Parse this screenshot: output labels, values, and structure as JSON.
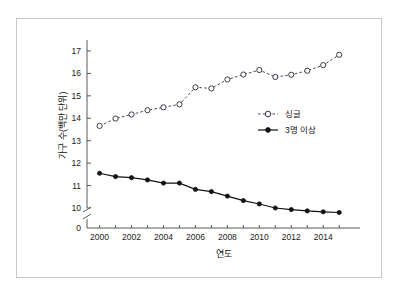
{
  "figure": {
    "frame_border_color": "#c9c9c9",
    "background_color": "#ffffff"
  },
  "axis": {
    "x_title": "연도",
    "y_title": "가구 수(백만 단위)",
    "y_zero_label": "0",
    "y_tick_labels": [
      "10",
      "11",
      "12",
      "13",
      "14",
      "15",
      "16",
      "17"
    ],
    "x_tick_labels": [
      "2000",
      "2002",
      "2004",
      "2006",
      "2008",
      "2010",
      "2012",
      "2014"
    ],
    "break_symbol": "axis-break"
  },
  "legend": {
    "entries": [
      {
        "label": "싱글",
        "marker": "open-circle",
        "line": "dashed",
        "color": "#3a3a44"
      },
      {
        "label": "3명 이상",
        "marker": "filled-circle",
        "line": "solid",
        "color": "#111111"
      }
    ]
  },
  "chart_data": {
    "type": "line",
    "title": "",
    "xlabel": "연도",
    "ylabel": "가구 수(백만 단위)",
    "x": [
      2000,
      2001,
      2002,
      2003,
      2004,
      2005,
      2006,
      2007,
      2008,
      2009,
      2010,
      2011,
      2012,
      2013,
      2014,
      2015
    ],
    "xlim": [
      1999.4,
      2015.8
    ],
    "ylim": [
      10,
      17.4
    ],
    "y_axis_break": {
      "from": 0,
      "to": 10
    },
    "grid": false,
    "legend_position": "center-right",
    "series": [
      {
        "name": "싱글",
        "marker": "open-circle",
        "linestyle": "dashed",
        "color": "#3a3a44",
        "values": [
          13.66,
          13.99,
          14.17,
          14.36,
          14.49,
          14.62,
          15.38,
          15.33,
          15.73,
          15.95,
          16.15,
          15.84,
          15.94,
          16.12,
          16.37,
          16.83
        ]
      },
      {
        "name": "3명 이상",
        "marker": "filled-circle",
        "linestyle": "solid",
        "color": "#111111",
        "values": [
          11.55,
          11.4,
          11.35,
          11.25,
          11.11,
          11.11,
          10.83,
          10.73,
          10.53,
          10.33,
          10.18,
          10.0,
          9.93,
          9.87,
          9.83,
          9.8
        ]
      }
    ]
  }
}
